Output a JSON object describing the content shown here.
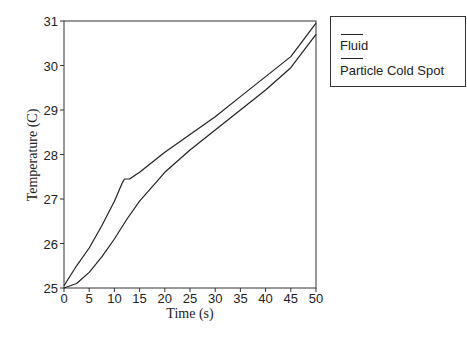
{
  "chart_data": {
    "type": "line",
    "title": "",
    "xlabel": "Time (s)",
    "ylabel": "Temperature (C)",
    "xlim": [
      0,
      50
    ],
    "ylim": [
      25,
      31
    ],
    "xticks": [
      0,
      5,
      10,
      15,
      20,
      25,
      30,
      35,
      40,
      45,
      50
    ],
    "yticks": [
      25,
      26,
      27,
      28,
      29,
      30,
      31
    ],
    "grid": false,
    "legend_position": "outside-right-top",
    "series": [
      {
        "name": "Fluid",
        "color": "#222222",
        "x": [
          0,
          2.5,
          5,
          7.5,
          10,
          11.5,
          12,
          13,
          15,
          20,
          25,
          30,
          35,
          40,
          45,
          50
        ],
        "y": [
          25.05,
          25.5,
          25.9,
          26.4,
          26.95,
          27.35,
          27.45,
          27.45,
          27.6,
          28.05,
          28.45,
          28.85,
          29.3,
          29.75,
          30.2,
          30.95
        ]
      },
      {
        "name": "Particle Cold Spot",
        "color": "#222222",
        "x": [
          0,
          2.5,
          5,
          7.5,
          10,
          12.5,
          15,
          20,
          25,
          30,
          35,
          40,
          45,
          50
        ],
        "y": [
          25.0,
          25.1,
          25.35,
          25.7,
          26.1,
          26.55,
          26.95,
          27.6,
          28.1,
          28.55,
          29.0,
          29.45,
          29.95,
          30.7
        ]
      }
    ]
  },
  "legend": {
    "items": [
      {
        "label": "Fluid"
      },
      {
        "label": "Particle Cold Spot"
      }
    ]
  }
}
